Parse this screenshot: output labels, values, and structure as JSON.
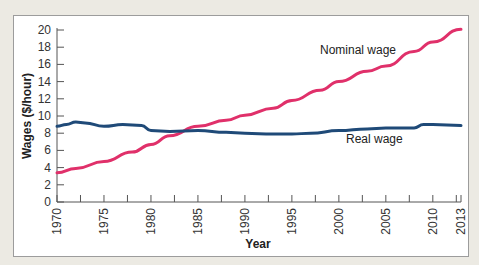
{
  "chart_data": {
    "type": "line",
    "title": "",
    "xlabel": "Year",
    "ylabel": "Wages ($/hour)",
    "ylim": [
      0,
      20
    ],
    "xlim": [
      1970,
      2013
    ],
    "y_ticks": [
      "0",
      "2",
      "4",
      "6",
      "8",
      "10",
      "12",
      "14",
      "16",
      "18",
      "20"
    ],
    "x_ticks": [
      "1970",
      "1975",
      "1980",
      "1985",
      "1990",
      "1995",
      "2000",
      "2005",
      "2010",
      "2013"
    ],
    "grid": false,
    "legend": "inline labels",
    "series": [
      {
        "name": "Nominal wage",
        "color": "#e0306a",
        "x": [
          1970,
          1972,
          1975,
          1978,
          1980,
          1982,
          1985,
          1988,
          1990,
          1993,
          1995,
          1998,
          2000,
          2003,
          2005,
          2008,
          2010,
          2013
        ],
        "values": [
          3.4,
          3.9,
          4.7,
          5.8,
          6.7,
          7.7,
          8.8,
          9.5,
          10.1,
          10.9,
          11.8,
          13.0,
          14.0,
          15.2,
          15.8,
          17.5,
          18.6,
          20.1
        ]
      },
      {
        "name": "Real wage",
        "color": "#1f4a78",
        "x": [
          1970,
          1971,
          1972,
          1973,
          1975,
          1977,
          1979,
          1980,
          1982,
          1985,
          1988,
          1990,
          1993,
          1995,
          1997,
          2000,
          2003,
          2005,
          2008,
          2009,
          2010,
          2013
        ],
        "values": [
          8.8,
          9.0,
          9.3,
          9.2,
          8.8,
          9.0,
          8.9,
          8.3,
          8.2,
          8.3,
          8.1,
          8.0,
          7.9,
          7.9,
          8.0,
          8.3,
          8.5,
          8.6,
          8.6,
          9.0,
          9.0,
          8.9
        ]
      }
    ]
  }
}
